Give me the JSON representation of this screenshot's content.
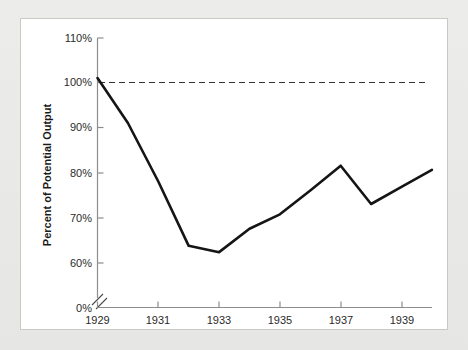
{
  "chart_data": {
    "type": "line",
    "title": "",
    "xlabel": "",
    "ylabel": "Percent of Potential Output",
    "x": [
      1929,
      1930,
      1931,
      1932,
      1933,
      1934,
      1935,
      1936,
      1937,
      1938,
      1939,
      1940
    ],
    "values": [
      101.0,
      91.0,
      78.0,
      63.7,
      62.3,
      67.5,
      70.7,
      76.0,
      81.5,
      73.0,
      76.8,
      80.6
    ],
    "series": [
      {
        "name": "Percent of Potential Output",
        "values": [
          101.0,
          91.0,
          78.0,
          63.7,
          62.3,
          67.5,
          70.7,
          76.0,
          81.5,
          73.0,
          76.8,
          80.6
        ]
      }
    ],
    "ylim": [
      60,
      110
    ],
    "xlim": [
      1929,
      1940
    ],
    "ytick_labels": [
      "110%",
      "100%",
      "90%",
      "80%",
      "70%",
      "60%",
      "0%"
    ],
    "ytick_values": [
      110,
      100,
      90,
      80,
      70,
      60,
      0
    ],
    "xtick_labels": [
      "1929",
      "1931",
      "1933",
      "1935",
      "1937",
      "1939"
    ],
    "xtick_values": [
      1929,
      1931,
      1933,
      1935,
      1937,
      1939
    ],
    "xminor_ticks": [
      1930,
      1932,
      1934,
      1936,
      1938,
      1940
    ],
    "grid": false,
    "legend": "none",
    "axis_break": true,
    "axis_break_note": "y-axis broken between 0% and 60%",
    "annotations": [
      {
        "type": "reference-line",
        "label": "100% potential output",
        "value": 100,
        "style": "dashed"
      }
    ],
    "colors": {
      "line": "#151515",
      "reference_line": "#333333",
      "axis": "#8d8d8d",
      "panel_background": "#ffffff",
      "figure_background": "#e9e9e7",
      "text": "#2b2b2b"
    }
  }
}
